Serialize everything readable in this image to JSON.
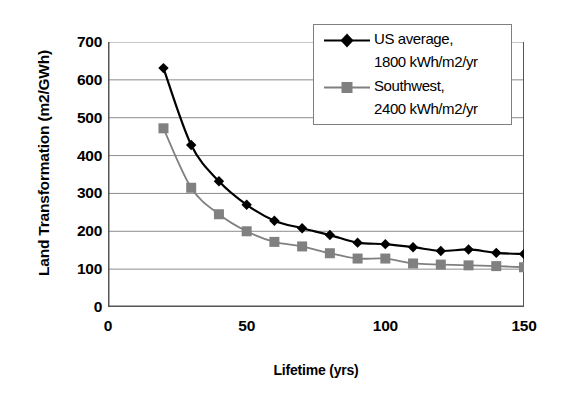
{
  "chart_data": {
    "type": "line",
    "title": "",
    "xlabel": "Lifetime (yrs)",
    "ylabel": "Land Transformation (m2/GWh)",
    "xlim": [
      0,
      150
    ],
    "ylim": [
      0,
      700
    ],
    "xticks": [
      0,
      50,
      100,
      150
    ],
    "yticks": [
      0,
      100,
      200,
      300,
      400,
      500,
      600,
      700
    ],
    "grid": "horizontal",
    "legend_position": "top-right",
    "x": [
      20,
      30,
      40,
      50,
      60,
      70,
      80,
      90,
      100,
      110,
      120,
      130,
      140,
      150
    ],
    "series": [
      {
        "name": "US average, 1800 kWh/m2/yr",
        "legend_line1": "US average,",
        "legend_line2": "1800 kWh/m2/yr",
        "marker": "diamond",
        "color": "#000000",
        "values": [
          631,
          428,
          332,
          270,
          228,
          208,
          190,
          170,
          166,
          158,
          148,
          152,
          143,
          140
        ]
      },
      {
        "name": "Southwest, 2400 kWh/m2/yr",
        "legend_line1": "Southwest,",
        "legend_line2": "2400 kWh/m2/yr",
        "marker": "square",
        "color": "#808080",
        "values": [
          472,
          315,
          245,
          200,
          172,
          160,
          142,
          128,
          128,
          115,
          112,
          110,
          108,
          105
        ]
      }
    ]
  },
  "axis": {
    "y_tick_labels": [
      "700",
      "600",
      "500",
      "400",
      "300",
      "200",
      "100",
      "0"
    ],
    "x_tick_labels": [
      "0",
      "50",
      "100",
      "150"
    ]
  },
  "colors": {
    "series1": "#000000",
    "series2": "#808080",
    "grid": "#8c8c8c",
    "axis": "#555555",
    "legend_border": "#808080",
    "background": "#ffffff"
  }
}
